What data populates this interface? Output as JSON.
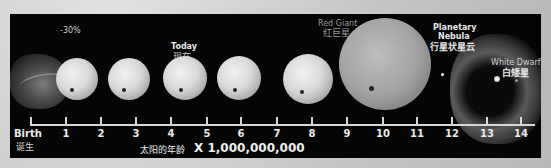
{
  "top_caption": "示意图",
  "stages": [
    {
      "name": "birth",
      "label_en": "Birth",
      "label_cn": "诞生"
    },
    {
      "name": "early-sun",
      "annotation": "-30%"
    },
    {
      "name": "today",
      "label_en": "Today",
      "label_cn": "现在"
    },
    {
      "name": "red-giant",
      "label_en": "Red Giant",
      "label_cn": "红巨星"
    },
    {
      "name": "planetary-nebula",
      "label_en_line1": "Planetary",
      "label_en_line2": "Nebula",
      "label_cn": "行星状星云"
    },
    {
      "name": "white-dwarf",
      "label_en": "White Dwarf",
      "label_cn": "白矮星"
    }
  ],
  "axis": {
    "ticks": [
      "1",
      "2",
      "3",
      "4",
      "5",
      "6",
      "7",
      "8",
      "9",
      "10",
      "11",
      "12",
      "13",
      "14"
    ],
    "start_label_en": "Birth",
    "start_label_cn": "诞生",
    "xlabel_cn": "太阳的年龄",
    "xlabel_multiplier": "X 1,000,000,000"
  },
  "colors": {
    "panel": "#050505",
    "text": "#e6e6e6",
    "background": "#cfcfcf"
  }
}
